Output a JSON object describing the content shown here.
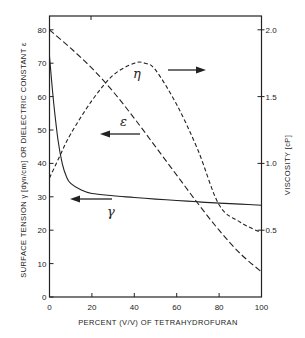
{
  "chart_data": {
    "type": "line",
    "title": "",
    "xlabel": "PERCENT (V/V) OF TETRAHYDROFURAN",
    "ylabel": "SURFACE TENSION γ [dyn/cm] OR DIELECTRIC CONSTANT ε",
    "y2label": "VISCOSITY [cP]",
    "xlim": [
      0,
      100
    ],
    "ylim": [
      0,
      85
    ],
    "y2lim": [
      0,
      2.125
    ],
    "x_ticks": [
      0,
      20,
      40,
      60,
      80,
      100
    ],
    "x_tick_labels": [
      "0",
      "20",
      "40",
      "60",
      "80",
      "100"
    ],
    "y_ticks": [
      0,
      10,
      20,
      30,
      40,
      50,
      60,
      70,
      80
    ],
    "y_tick_labels": [
      "0",
      "10",
      "20",
      "30",
      "40",
      "50",
      "60",
      "70",
      "80"
    ],
    "y2_ticks": [
      0.5,
      1.0,
      1.5,
      2.0
    ],
    "y2_tick_labels": [
      "0.5",
      "1.0",
      "1.5",
      "2.0"
    ],
    "grid": false,
    "legend": "none (curves labeled directly with arrows pointing to their axis)",
    "series": [
      {
        "name": "γ (surface tension, dyn/cm)",
        "label": "γ",
        "axis": "left",
        "style": "solid",
        "x": [
          0,
          2,
          4,
          6,
          8,
          10,
          15,
          20,
          30,
          40,
          50,
          60,
          70,
          80,
          90,
          100
        ],
        "values": [
          72,
          58,
          47,
          40,
          36,
          34,
          32,
          31,
          30.3,
          29.8,
          29.3,
          28.9,
          28.5,
          28.1,
          27.8,
          27.5
        ]
      },
      {
        "name": "ε (dielectric constant)",
        "label": "ε",
        "axis": "left",
        "style": "long-dash",
        "x": [
          0,
          10,
          20,
          30,
          40,
          50,
          60,
          70,
          80,
          90,
          100
        ],
        "values": [
          80,
          74.5,
          68.5,
          61.5,
          53.5,
          45,
          36.5,
          28,
          20,
          13,
          7.5
        ]
      },
      {
        "name": "η (viscosity, cP)",
        "label": "η",
        "axis": "right",
        "style": "short-dash",
        "x": [
          0,
          5,
          10,
          20,
          30,
          40,
          45,
          50,
          60,
          70,
          80,
          90,
          100
        ],
        "values": [
          0.89,
          1.06,
          1.22,
          1.47,
          1.66,
          1.75,
          1.75,
          1.7,
          1.44,
          1.1,
          0.69,
          0.56,
          0.48
        ]
      }
    ],
    "annotations": [
      {
        "text": "η",
        "arrow": "right",
        "points_to": "right axis"
      },
      {
        "text": "ε",
        "arrow": "left",
        "points_to": "left axis"
      },
      {
        "text": "γ",
        "arrow": "left",
        "points_to": "left axis"
      }
    ]
  },
  "labels": {
    "xlabel": "PERCENT (V/V) OF TETRAHYDROFURAN",
    "ylabel_left": "SURFACE TENSION γ [dyn/cm] OR DIELECTRIC CONSTANT ε",
    "ylabel_right": "VISCOSITY [cP]",
    "eta": "η",
    "epsilon": "ε",
    "gamma": "γ"
  }
}
